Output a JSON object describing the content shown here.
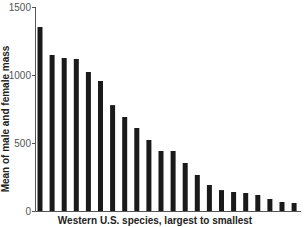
{
  "chart_data": {
    "type": "bar",
    "title": "",
    "xlabel": "Western U.S. species, largest to smallest",
    "ylabel": "Mean of male and female mass",
    "ylim": [
      0,
      1500
    ],
    "yticks": [
      0,
      500,
      1000,
      1500
    ],
    "ytick_labels": [
      "0",
      "500",
      "1000",
      "1500"
    ],
    "grid": false,
    "legend": null,
    "categories": [
      "1",
      "2",
      "3",
      "4",
      "5",
      "6",
      "7",
      "8",
      "9",
      "10",
      "11",
      "12",
      "13",
      "14",
      "15",
      "16",
      "17",
      "18",
      "19",
      "20",
      "21",
      "22"
    ],
    "values": [
      1353,
      1147,
      1125,
      1118,
      1022,
      956,
      779,
      691,
      610,
      522,
      441,
      441,
      353,
      265,
      191,
      154,
      140,
      132,
      118,
      88,
      66,
      59
    ],
    "bar_color": "#1a1a1a",
    "axis_color": "#555555"
  }
}
